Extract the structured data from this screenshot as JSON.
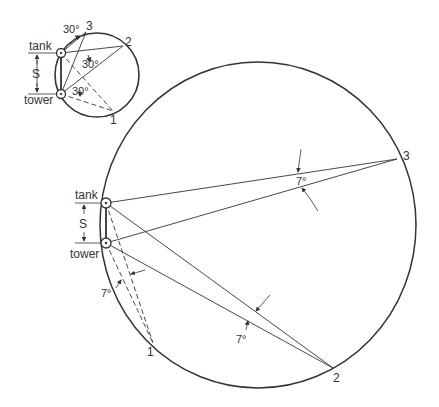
{
  "small_diagram": {
    "tank_label": "tank",
    "tower_label": "tower",
    "spacing_label": "S",
    "angle_labels": [
      "30°",
      "30°",
      "30°"
    ],
    "point_labels": [
      "1",
      "2",
      "3"
    ]
  },
  "large_diagram": {
    "tank_label": "tank",
    "tower_label": "tower",
    "spacing_label": "S",
    "angle_labels": [
      "7°",
      "7°",
      "7°"
    ],
    "point_labels": [
      "1",
      "2",
      "3"
    ]
  },
  "colors": {
    "line": "#333333",
    "background": "#ffffff"
  }
}
